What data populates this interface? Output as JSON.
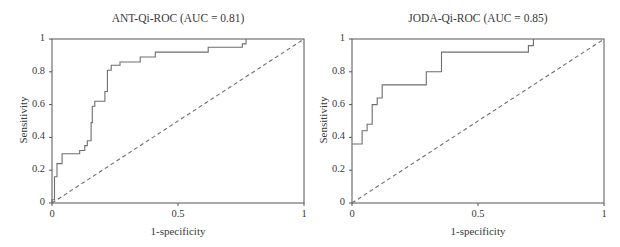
{
  "chart_data": [
    {
      "type": "line",
      "title": "ANT-Qi-ROC (AUC = 0.81)",
      "xlabel": "1-specificity",
      "ylabel": "Sensitivity",
      "xlim": [
        0,
        1
      ],
      "ylim": [
        0,
        1
      ],
      "xticks": [
        "0",
        "0.5",
        "1"
      ],
      "yticks": [
        "0",
        "0.2",
        "0.4",
        "0.6",
        "0.8",
        "1"
      ],
      "grid": false,
      "legend": null,
      "auc": 0.81,
      "series": [
        {
          "name": "ROC curve",
          "style": "solid step",
          "points": [
            [
              0,
              0
            ],
            [
              0,
              0.02
            ],
            [
              0.01,
              0.02
            ],
            [
              0.01,
              0.16
            ],
            [
              0.02,
              0.16
            ],
            [
              0.02,
              0.24
            ],
            [
              0.04,
              0.24
            ],
            [
              0.04,
              0.3
            ],
            [
              0.11,
              0.3
            ],
            [
              0.11,
              0.32
            ],
            [
              0.13,
              0.32
            ],
            [
              0.13,
              0.35
            ],
            [
              0.14,
              0.35
            ],
            [
              0.14,
              0.38
            ],
            [
              0.155,
              0.38
            ],
            [
              0.155,
              0.49
            ],
            [
              0.16,
              0.49
            ],
            [
              0.16,
              0.59
            ],
            [
              0.17,
              0.59
            ],
            [
              0.17,
              0.62
            ],
            [
              0.21,
              0.62
            ],
            [
              0.21,
              0.68
            ],
            [
              0.22,
              0.68
            ],
            [
              0.22,
              0.81
            ],
            [
              0.235,
              0.81
            ],
            [
              0.235,
              0.84
            ],
            [
              0.27,
              0.84
            ],
            [
              0.27,
              0.86
            ],
            [
              0.35,
              0.86
            ],
            [
              0.35,
              0.89
            ],
            [
              0.41,
              0.89
            ],
            [
              0.41,
              0.92
            ],
            [
              0.62,
              0.92
            ],
            [
              0.62,
              0.95
            ],
            [
              0.755,
              0.95
            ],
            [
              0.755,
              0.97
            ],
            [
              0.77,
              0.97
            ],
            [
              0.77,
              1.0
            ]
          ]
        },
        {
          "name": "Reference line",
          "style": "dashed",
          "points": [
            [
              0,
              0
            ],
            [
              1,
              1
            ]
          ]
        }
      ]
    },
    {
      "type": "line",
      "title": "JODA-Qi-ROC (AUC = 0.85)",
      "xlabel": "1-specificity",
      "ylabel": "Sensitivity",
      "xlim": [
        0,
        1
      ],
      "ylim": [
        0,
        1
      ],
      "xticks": [
        "0",
        "0.5",
        "1"
      ],
      "yticks": [
        "0",
        "0.2",
        "0.4",
        "0.6",
        "0.8",
        "1"
      ],
      "grid": false,
      "legend": null,
      "auc": 0.85,
      "series": [
        {
          "name": "ROC curve",
          "style": "solid step",
          "points": [
            [
              0,
              0.36
            ],
            [
              0.04,
              0.36
            ],
            [
              0.04,
              0.44
            ],
            [
              0.06,
              0.44
            ],
            [
              0.06,
              0.48
            ],
            [
              0.08,
              0.48
            ],
            [
              0.08,
              0.6
            ],
            [
              0.1,
              0.6
            ],
            [
              0.1,
              0.64
            ],
            [
              0.12,
              0.64
            ],
            [
              0.12,
              0.72
            ],
            [
              0.295,
              0.72
            ],
            [
              0.295,
              0.8
            ],
            [
              0.355,
              0.8
            ],
            [
              0.355,
              0.92
            ],
            [
              0.7,
              0.92
            ],
            [
              0.7,
              0.96
            ],
            [
              0.72,
              0.96
            ],
            [
              0.72,
              1.0
            ]
          ]
        },
        {
          "name": "Reference line",
          "style": "dashed",
          "points": [
            [
              0,
              0
            ],
            [
              1,
              1
            ]
          ]
        }
      ]
    }
  ],
  "colors": {
    "curve": "#6e6e6e",
    "axis": "#555555",
    "text": "#3a3a3a",
    "background": "#ffffff"
  }
}
